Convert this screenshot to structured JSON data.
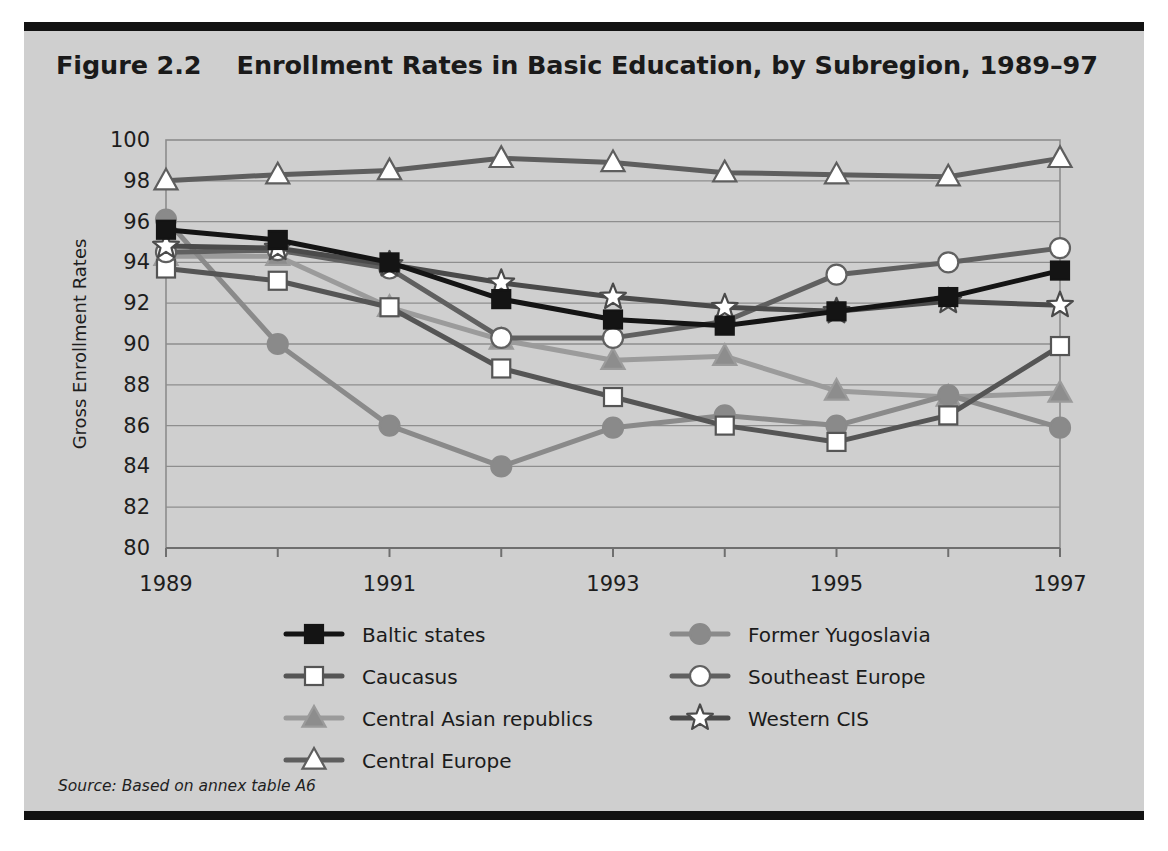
{
  "figure": {
    "number_label": "Figure 2.2",
    "title": "Enrollment Rates in Basic Education, by Subregion, 1989–97",
    "title_full": "Figure 2.2    Enrollment Rates in Basic Education, by Subregion, 1989–97",
    "source_note": "Source: Based on annex table A6"
  },
  "colors": {
    "panel_background": "#cfcfcf",
    "rule": "#121212",
    "gridline": "#8e8e8e",
    "frame": "#8c8c8c",
    "text": "#1b1b1b",
    "baltic": "#141414",
    "caucasus": "#555555",
    "central_asian": "#9b9b9b",
    "central_europe": "#5e5e5e",
    "former_yugoslavia": "#8a8a8a",
    "southeast_europe": "#606060",
    "western_cis": "#4a4a4a"
  },
  "chart_data": {
    "type": "line",
    "title": "Enrollment Rates in Basic Education, by Subregion, 1989–97",
    "xlabel": "",
    "ylabel": "Gross Enrollment Rates",
    "x": [
      1989,
      1990,
      1991,
      1992,
      1993,
      1994,
      1995,
      1996,
      1997
    ],
    "xtick_labels": [
      "1989",
      "",
      "1991",
      "",
      "1993",
      "",
      "1995",
      "",
      "1997"
    ],
    "xlim": [
      1989,
      1997
    ],
    "ylim": [
      80,
      100
    ],
    "yticks": [
      80,
      82,
      84,
      86,
      88,
      90,
      92,
      94,
      96,
      98,
      100
    ],
    "ytick_labels": [
      "80",
      "82",
      "84",
      "86",
      "88",
      "90",
      "92",
      "94",
      "96",
      "98",
      "100"
    ],
    "grid": true,
    "legend_position": "below-plot",
    "series": [
      {
        "name": "Baltic states",
        "marker": "square-filled",
        "color": "#141414",
        "marker_fill": "#141414",
        "values": [
          95.6,
          95.1,
          94.0,
          92.2,
          91.2,
          90.9,
          91.6,
          92.3,
          93.6
        ]
      },
      {
        "name": "Caucasus",
        "marker": "square-open",
        "color": "#555555",
        "marker_fill": "#ffffff",
        "values": [
          93.7,
          93.1,
          91.8,
          88.8,
          87.4,
          86.0,
          85.2,
          86.5,
          89.9
        ]
      },
      {
        "name": "Central Asian republics",
        "marker": "triangle-filled",
        "color": "#9b9b9b",
        "marker_fill": "#8d8d8d",
        "values": [
          94.3,
          94.3,
          91.8,
          90.2,
          89.2,
          89.4,
          87.7,
          87.4,
          87.6
        ]
      },
      {
        "name": "Central Europe",
        "marker": "triangle-open",
        "color": "#5e5e5e",
        "marker_fill": "#ffffff",
        "values": [
          98.0,
          98.3,
          98.5,
          99.1,
          98.9,
          98.4,
          98.3,
          98.2,
          99.1
        ]
      },
      {
        "name": "Former Yugoslavia",
        "marker": "circle-filled",
        "color": "#8a8a8a",
        "marker_fill": "#8a8a8a",
        "values": [
          96.1,
          90.0,
          86.0,
          84.0,
          85.9,
          86.5,
          86.0,
          87.5,
          85.9
        ]
      },
      {
        "name": "Southeast Europe",
        "marker": "circle-open",
        "color": "#606060",
        "marker_fill": "#ffffff",
        "values": [
          94.5,
          94.6,
          93.7,
          90.3,
          90.3,
          91.1,
          93.4,
          94.0,
          94.7
        ]
      },
      {
        "name": "Western CIS",
        "marker": "star-open",
        "color": "#4a4a4a",
        "marker_fill": "#ffffff",
        "values": [
          94.8,
          94.7,
          93.9,
          93.0,
          92.3,
          91.8,
          91.6,
          92.1,
          91.9
        ]
      }
    ]
  },
  "legend": {
    "columns": [
      [
        "Baltic states",
        "Caucasus",
        "Central Asian republics",
        "Central Europe"
      ],
      [
        "Former Yugoslavia",
        "Southeast Europe",
        "Western CIS"
      ]
    ]
  }
}
